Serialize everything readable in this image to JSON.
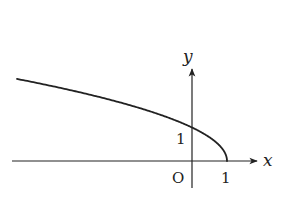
{
  "chart_data": {
    "type": "line",
    "title": "",
    "function": "y = sqrt(1 - x)",
    "xlabel": "x",
    "ylabel": "y",
    "origin_label": "O",
    "x_ticks": [
      {
        "value": 1,
        "label": "1"
      }
    ],
    "y_ticks": [
      {
        "value": 1,
        "label": "1"
      }
    ],
    "xlim": [
      -5.1,
      1.9
    ],
    "ylim": [
      -1.1,
      2.6
    ],
    "grid": false,
    "legend": null,
    "series": [
      {
        "name": "y = sqrt(1-x)",
        "x": [
          -5,
          -4,
          -3,
          -2,
          -1,
          0,
          0.5,
          0.75,
          0.9,
          1
        ],
        "y": [
          2.449,
          2.236,
          2.0,
          1.732,
          1.414,
          1.0,
          0.707,
          0.5,
          0.316,
          0.0
        ]
      }
    ],
    "colors": {
      "line": "#222222",
      "axes": "#222222"
    }
  },
  "labels": {
    "x_axis": "x",
    "y_axis": "y",
    "origin": "O",
    "x_tick_1": "1",
    "y_tick_1": "1"
  }
}
